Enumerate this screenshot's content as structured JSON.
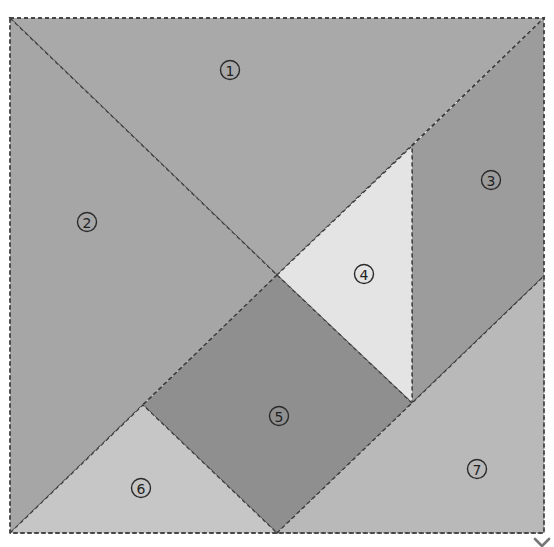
{
  "diagram": {
    "type": "tangram",
    "background": "#ffffff",
    "outline": {
      "x": 10,
      "y": 18,
      "width": 534,
      "height": 515
    },
    "pieces": [
      {
        "id": 1,
        "label": "1",
        "shape": "large-triangle",
        "color": "#a9a9a9",
        "points": "10,18 544,18 277,275",
        "label_pos": [
          230,
          70
        ]
      },
      {
        "id": 2,
        "label": "2",
        "shape": "large-triangle",
        "color": "#a6a6a6",
        "points": "10,18 277,275 10,533",
        "label_pos": [
          87,
          222
        ]
      },
      {
        "id": 3,
        "label": "3",
        "shape": "parallelogram",
        "color": "#9c9c9c",
        "points": "412,146 544,18 544,276 412,403",
        "label_pos": [
          491,
          180
        ]
      },
      {
        "id": 4,
        "label": "4",
        "shape": "small-triangle",
        "color": "#e4e4e4",
        "points": "277,275 412,146 412,403",
        "label_pos": [
          364,
          274
        ]
      },
      {
        "id": 5,
        "label": "5",
        "shape": "square",
        "color": "#8f8f8f",
        "points": "277,275 412,403 277,533 143,405",
        "label_pos": [
          279,
          416
        ]
      },
      {
        "id": 6,
        "label": "6",
        "shape": "small-triangle",
        "color": "#c6c6c6",
        "points": "10,533 143,405 277,533",
        "label_pos": [
          141,
          488
        ]
      },
      {
        "id": 7,
        "label": "7",
        "shape": "medium-triangle",
        "color": "#b9b9b9",
        "points": "277,533 544,276 544,533",
        "label_pos": [
          477,
          469
        ]
      }
    ],
    "labels_text": [
      "①",
      "②",
      "③",
      "④",
      "⑤",
      "⑥",
      "⑦"
    ]
  },
  "chevron": {
    "icon": "chevron-down-icon",
    "color": "#777777"
  }
}
